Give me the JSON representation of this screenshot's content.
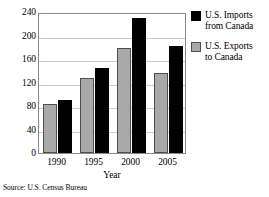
{
  "chart_data": {
    "type": "bar",
    "title": "",
    "xlabel": "Year",
    "ylabel": "",
    "categories": [
      "1990",
      "1995",
      "2000",
      "2005"
    ],
    "series": [
      {
        "name": "U.S. Exports to Canada",
        "color": "#a9a9a9",
        "values": [
          84,
          128,
          178,
          137
        ]
      },
      {
        "name": "U.S. Imports from Canada",
        "color": "#000000",
        "values": [
          91,
          145,
          230,
          183
        ]
      }
    ],
    "ylim": [
      0,
      240
    ],
    "yticks": [
      0,
      40,
      80,
      120,
      160,
      200,
      240
    ],
    "ytick_labels": [
      "0",
      "40",
      "80",
      "120",
      "160",
      "200",
      "240"
    ],
    "grid": true,
    "legend_position": "right"
  },
  "legend": {
    "items": [
      {
        "label_line1": "U.S. Imports",
        "label_line2": "from Canada",
        "swatch": "black-square-icon"
      },
      {
        "label_line1": "U.S. Exports",
        "label_line2": "to Canada",
        "swatch": "gray-square-icon"
      }
    ]
  },
  "source": {
    "text": "Source: U.S. Census Bureau"
  }
}
